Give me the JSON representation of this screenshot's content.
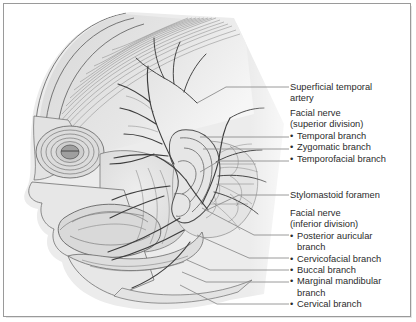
{
  "figure": {
    "kind": "anatomical-illustration",
    "view": "left lateral profile"
  },
  "colors": {
    "frame": "#9a9a9a",
    "text": "#2b2b2b",
    "leader_line": "#8e8e8e",
    "art_line": "#4a4a4a",
    "art_fill_light": "#ebebeb",
    "art_fill_mid": "#d2d2d2",
    "art_fill_dark": "#b4b4b4",
    "background": "#ffffff"
  },
  "labels": [
    {
      "id": "superficial-temporal-artery",
      "type": "plain",
      "lines": [
        "Superficial temporal",
        "artery"
      ],
      "x": 4,
      "y": 78
    },
    {
      "id": "facial-nerve-superior-division",
      "type": "group",
      "heading": [
        "Facial nerve",
        "(superior division)"
      ],
      "items": [
        {
          "text": "Temporal branch"
        },
        {
          "text": "Zygomatic branch"
        },
        {
          "text": "Temporofacial branch"
        }
      ],
      "x": 4,
      "y": 104
    },
    {
      "id": "stylomastoid-foramen",
      "type": "plain",
      "lines": [
        "Stylomastoid foramen"
      ],
      "x": 4,
      "y": 186
    },
    {
      "id": "facial-nerve-inferior-division",
      "type": "group",
      "heading": [
        "Facial nerve",
        "(inferior division)"
      ],
      "items": [
        {
          "text": "Posterior auricular",
          "cont": "branch"
        },
        {
          "text": "Cervicofacial branch"
        },
        {
          "text": "Buccal branch"
        },
        {
          "text": "Marginal mandibular",
          "cont": "branch"
        },
        {
          "text": "Cervical branch"
        }
      ],
      "x": 4,
      "y": 204
    }
  ],
  "leader_lines": [
    {
      "id": "lead-superficial-temporal-artery",
      "points": "285,83 222,83 193,99"
    },
    {
      "id": "lead-temporal-branch",
      "points": "285,133 196,133"
    },
    {
      "id": "lead-zygomatic-branch",
      "points": "285,145 199,145"
    },
    {
      "id": "lead-temporofacial-branch",
      "points": "285,157 215,157 196,168"
    },
    {
      "id": "lead-stylomastoid-foramen",
      "points": "285,191 235,191 203,206"
    },
    {
      "id": "lead-posterior-auricular-branch",
      "points": "285,231 250,231 198,204"
    },
    {
      "id": "lead-cervicofacial-branch",
      "points": "285,254 245,254 193,231"
    },
    {
      "id": "lead-buccal-branch",
      "points": "285,266 206,266 183,256"
    },
    {
      "id": "lead-marginal-mandibular-branch",
      "points": "285,278 202,278 178,268"
    },
    {
      "id": "lead-cervical-branch",
      "points": "285,300 213,300 176,281"
    }
  ]
}
